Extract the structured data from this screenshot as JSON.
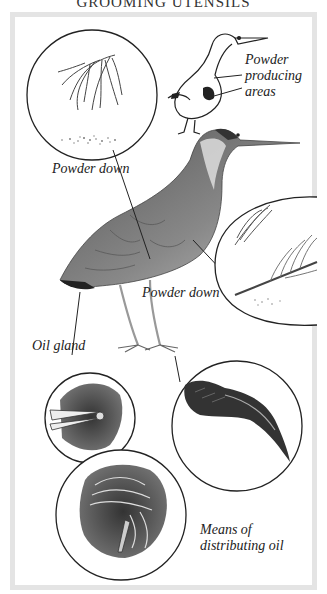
{
  "title": "GROOMING UTENSILS",
  "labels": {
    "powder_producing_areas": [
      "Powder",
      "producing",
      "areas"
    ],
    "powder_down_left": "Powder down",
    "powder_down_right": "Powder down",
    "oil_gland": "Oil gland",
    "means_of_distributing_oil": [
      "Means of",
      "distributing oil"
    ]
  },
  "illustrations": [
    {
      "id": "powder-down-feather-circle",
      "depicts": "powder down feather with dust"
    },
    {
      "id": "outline-heron-diagram",
      "depicts": "outline bird with powder producing areas"
    },
    {
      "id": "bittern-main",
      "depicts": "bittern standing"
    },
    {
      "id": "feather-detail-circle",
      "depicts": "contour feather and down with powder"
    },
    {
      "id": "oil-gland-circle",
      "depicts": "oil gland among feathers"
    },
    {
      "id": "comb-claw-circle",
      "depicts": "pectinate middle claw"
    },
    {
      "id": "preening-circle",
      "depicts": "bird preening to distribute oil"
    }
  ],
  "colors": {
    "frame": "#e4e4e4",
    "ink": "#222222",
    "background": "#ffffff"
  }
}
